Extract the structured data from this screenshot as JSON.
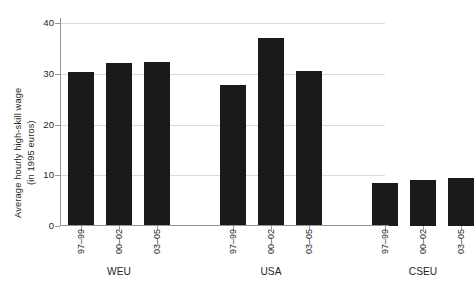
{
  "chart_data": {
    "type": "bar",
    "title": "",
    "subtitle": "",
    "xlabel": "",
    "ylabel_line1": "Average hourly high-skill wage",
    "ylabel_line2": "(in 1995 euros)",
    "ylim": [
      0,
      42
    ],
    "yticks": [
      0,
      10,
      20,
      30,
      40
    ],
    "ytick_labels": [
      "0",
      "10",
      "20",
      "30",
      "40"
    ],
    "grid": true,
    "grid_axis": "y",
    "legend": false,
    "bar_color": "#1a1a1a",
    "grid_color": "#d9dadb",
    "axis_color": "#939598",
    "categories": [
      "97–99",
      "00–02",
      "03–05"
    ],
    "groups": [
      {
        "label": "WEU",
        "values": [
          30.4,
          32.2,
          32.3
        ]
      },
      {
        "label": "USA",
        "values": [
          27.8,
          37.1,
          30.6
        ]
      },
      {
        "label": "CSEU",
        "values": [
          8.5,
          9.0,
          9.5
        ]
      }
    ],
    "bars": [
      {
        "group": "WEU",
        "category": "97–99",
        "value": 30.4
      },
      {
        "group": "WEU",
        "category": "00–02",
        "value": 32.2
      },
      {
        "group": "WEU",
        "category": "03–05",
        "value": 32.3
      },
      {
        "group": "USA",
        "category": "97–99",
        "value": 27.8
      },
      {
        "group": "USA",
        "category": "00–02",
        "value": 37.1
      },
      {
        "group": "USA",
        "category": "03–05",
        "value": 30.6
      },
      {
        "group": "CSEU",
        "category": "97–99",
        "value": 8.5
      },
      {
        "group": "CSEU",
        "category": "00–02",
        "value": 9.0
      },
      {
        "group": "CSEU",
        "category": "03–05",
        "value": 9.5
      }
    ]
  }
}
